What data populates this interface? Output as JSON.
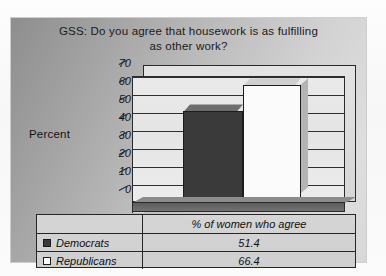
{
  "chart_data": {
    "type": "bar",
    "title": "GSS: Do you agree that housework is as fulfilling as other work?",
    "title_line1": "GSS: Do you agree that housework is as fulfilling",
    "title_line2": "as other work?",
    "ylabel": "Percent",
    "xlabel": "",
    "categories": [
      "% of women who agree"
    ],
    "category_label": "% of women who agree",
    "series": [
      {
        "name": "Democrats",
        "values": [
          51.4
        ],
        "color": "#3a3a3a"
      },
      {
        "name": "Republicans",
        "values": [
          66.4
        ],
        "color": "#fbfbfb"
      }
    ],
    "ylim": [
      0,
      70
    ],
    "ytick_labels": [
      "70",
      "60",
      "50",
      "40",
      "30",
      "20",
      "10",
      "0"
    ],
    "ytick_values": [
      70,
      60,
      50,
      40,
      30,
      20,
      10,
      0
    ],
    "grid": true,
    "legend_position": "bottom-table",
    "style_3d": true
  },
  "table": {
    "header": {
      "name": "",
      "value": "% of women who agree"
    },
    "rows": [
      {
        "swatch": "dark-square-swatch",
        "name": "Democrats",
        "value": "51.4"
      },
      {
        "swatch": "light-square-swatch",
        "name": "Republicans",
        "value": "66.4"
      }
    ]
  },
  "colors": {
    "democrat_bar": "#3a3a3a",
    "republican_bar": "#fbfbfb",
    "panel_background": "#bcbcbc",
    "plot_background": "#e8e8e8",
    "axis": "#2a2a2a"
  }
}
